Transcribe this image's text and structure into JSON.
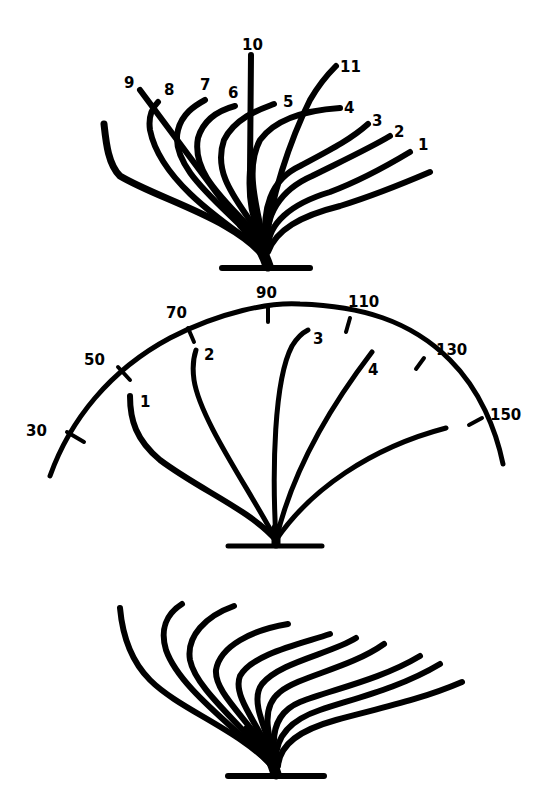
{
  "figure": {
    "colors": {
      "ink": "#000000",
      "background": "#ffffff"
    },
    "top_fan": {
      "labels": [
        "1",
        "2",
        "3",
        "4",
        "5",
        "6",
        "7",
        "8",
        "9",
        "10",
        "11"
      ]
    },
    "protractor_fan": {
      "scale_ticks": [
        "30",
        "50",
        "70",
        "90",
        "110",
        "130",
        "150"
      ],
      "stroke_labels": [
        "1",
        "2",
        "3",
        "4"
      ]
    },
    "bottom_fan": {
      "labels": []
    }
  }
}
